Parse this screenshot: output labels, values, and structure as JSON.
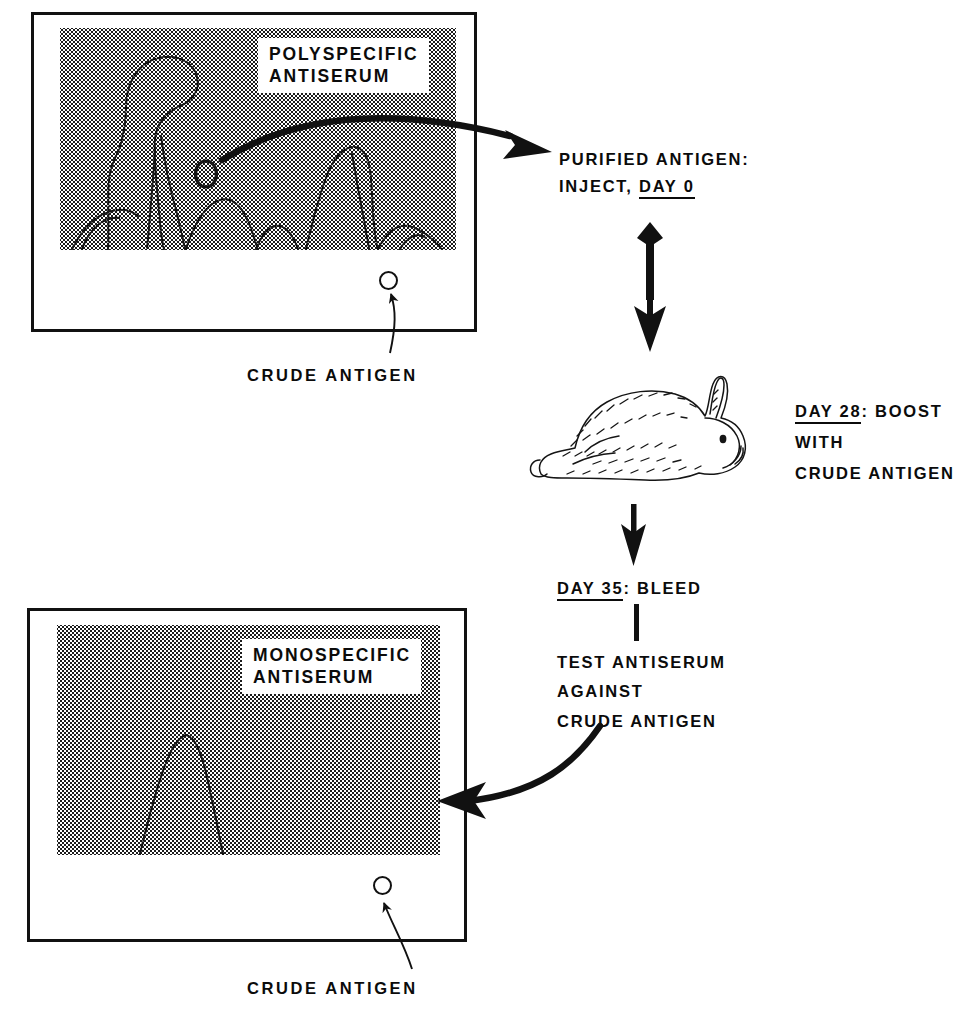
{
  "figure": {
    "type": "diagram",
    "background_color": "#ffffff",
    "ink_color": "#0b0b0b"
  },
  "top_panel": {
    "name": "polyspecific-antiserum-immunoelectrophoresis",
    "label_lines": [
      "POLYSPECIFIC",
      "ANTISERUM"
    ],
    "gel_description": "Immunoelectrophoresis pattern with multiple precipitin arcs",
    "arc_count": 6,
    "well_caption": "CRUDE ANTIGEN"
  },
  "bottom_panel": {
    "name": "monospecific-antiserum-immunoelectrophoresis",
    "label_lines": [
      "MONOSPECIFIC",
      "ANTISERUM"
    ],
    "gel_description": "Immunoelectrophoresis pattern with a single precipitin arc",
    "arc_count": 1,
    "well_caption": "CRUDE ANTIGEN"
  },
  "steps": {
    "inject": {
      "line1": "PURIFIED ANTIGEN:",
      "line2_prefix": "INJECT, ",
      "line2_underlined": "DAY 0"
    },
    "boost": {
      "line1_underlined": "DAY 28",
      "line1_rest": ": BOOST",
      "line2": "WITH",
      "line3": "CRUDE ANTIGEN"
    },
    "bleed": {
      "underlined": "DAY 35",
      "rest": ": BLEED"
    },
    "test": {
      "line1": "TEST ANTISERUM",
      "line2": "AGAINST",
      "line3": "CRUDE ANTIGEN"
    }
  },
  "animal": {
    "name": "rabbit",
    "description": "Line-drawn crouching rabbit facing right"
  },
  "connectors": {
    "top_curved_arrow": "Curved arrow from polyspecific gel to purified antigen step",
    "dart_arrow": "Fletched dart arrow from injection step down to rabbit",
    "rabbit_arrow": "Straight down arrow from rabbit to DAY 35 BLEED",
    "stem_line": "Short vertical line from DAY 35 BLEED to TEST ANTISERUM",
    "bottom_curved_arrow": "Curved arrow from test step to monospecific gel",
    "top_well_pointer": "Curved pointer from CRUDE ANTIGEN caption to the well",
    "bottom_well_pointer": "Curved pointer from CRUDE ANTIGEN caption to the well"
  }
}
